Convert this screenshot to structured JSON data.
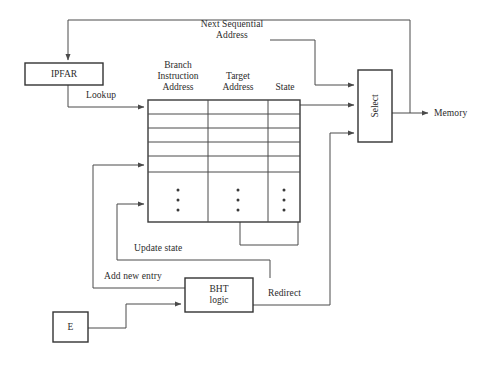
{
  "diagram": {
    "boxes": {
      "ipfar": {
        "label": "IPFAR"
      },
      "select": {
        "label": "Select"
      },
      "bht_logic": {
        "label": "BHT\nlogic"
      },
      "e_unit": {
        "label": "E"
      }
    },
    "table": {
      "columns": [
        {
          "header": "Branch\nInstruction\nAddress"
        },
        {
          "header": "Target\nAddress"
        },
        {
          "header": "State"
        }
      ],
      "empty_row_count": 5,
      "continuation_dots": "•"
    },
    "edge_labels": {
      "next_sequential_address": "Next Sequential\nAddress",
      "lookup": "Lookup",
      "memory": "Memory",
      "update_state": "Update state",
      "add_new_entry": "Add new entry",
      "redirect": "Redirect"
    },
    "colors": {
      "background": "#ffffff",
      "wire": "#4a4a4a",
      "box_border": "#333333",
      "text": "#2b2b2b"
    }
  }
}
